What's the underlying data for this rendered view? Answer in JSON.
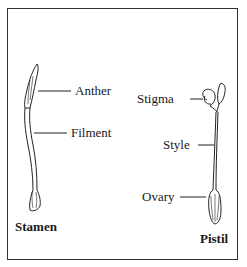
{
  "figure": {
    "stamen": {
      "title": "Stamen",
      "labels": {
        "anther": "Anther",
        "filament": "Filment"
      }
    },
    "pistil": {
      "title": "Pistil",
      "labels": {
        "stigma": "Stigma",
        "style": "Style",
        "ovary": "Ovary"
      }
    }
  }
}
